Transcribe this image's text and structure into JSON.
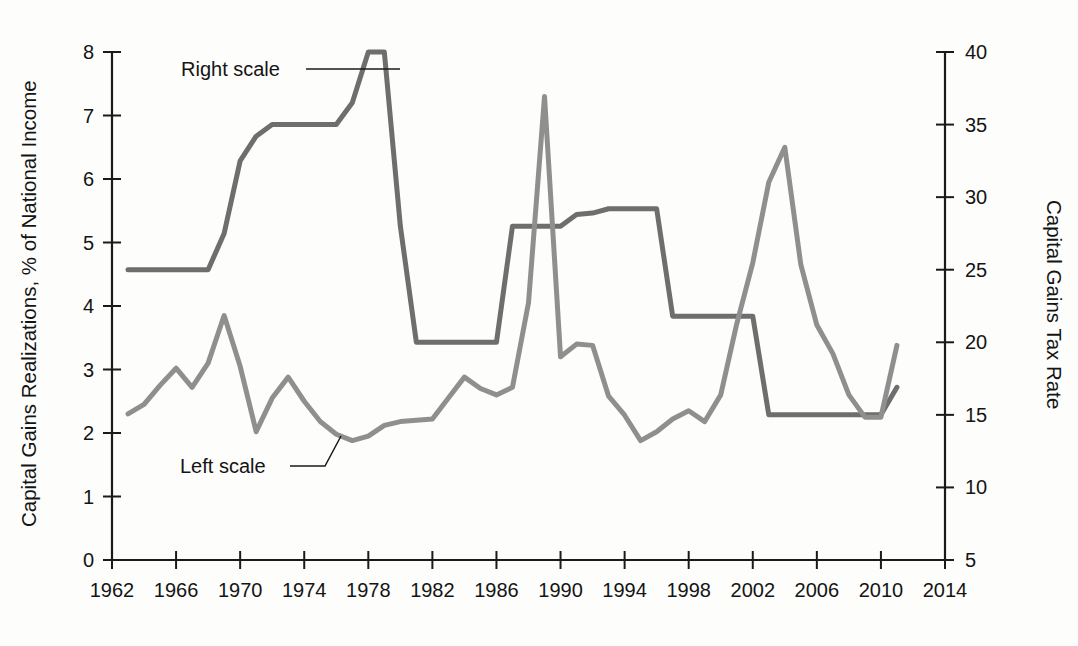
{
  "chart_data": {
    "type": "line",
    "title": "",
    "xlabel": "",
    "ylabel": "Capital Gains Realizations, % of National Income",
    "y2label": "Capital Gains Tax Rate",
    "xlim": [
      1962,
      2014
    ],
    "ylim": [
      0,
      8
    ],
    "y2lim": [
      5,
      40
    ],
    "grid": false,
    "legend": "inline-annotations",
    "x_ticks": [
      1962,
      1966,
      1970,
      1974,
      1978,
      1982,
      1986,
      1990,
      1994,
      1998,
      2002,
      2006,
      2010,
      2014
    ],
    "y_ticks": [
      0,
      1,
      2,
      3,
      4,
      5,
      6,
      7,
      8
    ],
    "y2_ticks": [
      5,
      10,
      15,
      20,
      25,
      30,
      35,
      40
    ],
    "annotations": [
      {
        "text": "Right scale",
        "points_to": "capital_gains_tax_rate"
      },
      {
        "text": "Left scale",
        "points_to": "capital_gains_realizations"
      }
    ],
    "series": [
      {
        "name": "Capital Gains Realizations, % of National Income",
        "axis": "left",
        "color": "#8f8f8f",
        "x": [
          1963,
          1964,
          1965,
          1966,
          1967,
          1968,
          1969,
          1970,
          1971,
          1972,
          1973,
          1974,
          1975,
          1976,
          1977,
          1978,
          1979,
          1980,
          1981,
          1982,
          1983,
          1984,
          1985,
          1986,
          1987,
          1988,
          1989,
          1990,
          1991,
          1992,
          1993,
          1994,
          1995,
          1996,
          1997,
          1998,
          1999,
          2000,
          2001,
          2002,
          2003,
          2004,
          2005,
          2006,
          2007,
          2008,
          2009,
          2010,
          2011
        ],
        "values": [
          2.3,
          2.45,
          2.75,
          3.02,
          2.72,
          3.1,
          3.85,
          3.05,
          2.02,
          2.55,
          2.88,
          2.5,
          2.18,
          1.98,
          1.88,
          1.95,
          2.12,
          2.18,
          2.2,
          2.22,
          2.55,
          2.88,
          2.7,
          2.6,
          2.72,
          4.05,
          7.3,
          3.2,
          3.4,
          3.38,
          2.58,
          2.28,
          1.88,
          2.02,
          2.22,
          2.35,
          2.18,
          2.6,
          3.72,
          4.68,
          5.95,
          6.5,
          4.65,
          3.7,
          3.25,
          2.6,
          2.25,
          2.25,
          3.38
        ],
        "linewidth": 5
      },
      {
        "name": "Capital Gains Tax Rate",
        "axis": "right",
        "color": "#6e6e6e",
        "x": [
          1963,
          1964,
          1965,
          1966,
          1967,
          1968,
          1969,
          1970,
          1971,
          1972,
          1973,
          1974,
          1975,
          1976,
          1977,
          1978,
          1979,
          1980,
          1981,
          1982,
          1983,
          1984,
          1985,
          1986,
          1987,
          1988,
          1989,
          1990,
          1991,
          1992,
          1993,
          1994,
          1995,
          1996,
          1997,
          1998,
          1999,
          2000,
          2001,
          2002,
          2003,
          2004,
          2005,
          2006,
          2007,
          2008,
          2009,
          2010,
          2011
        ],
        "values": [
          25.0,
          25.0,
          25.0,
          25.0,
          25.0,
          25.0,
          27.5,
          32.5,
          34.2,
          35.0,
          35.0,
          35.0,
          35.0,
          35.0,
          36.5,
          40.0,
          40.0,
          28.0,
          20.0,
          20.0,
          20.0,
          20.0,
          20.0,
          20.0,
          28.0,
          28.0,
          28.0,
          28.0,
          28.8,
          28.9,
          29.2,
          29.2,
          29.2,
          29.2,
          21.8,
          21.8,
          21.8,
          21.8,
          21.8,
          21.8,
          15.0,
          15.0,
          15.0,
          15.0,
          15.0,
          15.0,
          15.0,
          15.0,
          16.9
        ],
        "linewidth": 5
      }
    ]
  },
  "axes": {
    "left_title": "Capital Gains Realizations, % of National Income",
    "right_title": "Capital Gains Tax Rate",
    "left_ticks": [
      "8",
      "7",
      "6",
      "5",
      "4",
      "3",
      "2",
      "1",
      "0"
    ],
    "right_ticks": [
      "40",
      "35",
      "30",
      "25",
      "20",
      "15",
      "10",
      "5"
    ],
    "x_ticks": [
      "1962",
      "1966",
      "1970",
      "1974",
      "1978",
      "1982",
      "1986",
      "1990",
      "1994",
      "1998",
      "2002",
      "2006",
      "2010",
      "2014"
    ]
  },
  "annotations": {
    "right_scale_label": "Right scale",
    "left_scale_label": "Left scale"
  },
  "colors": {
    "background": "#fdfdfc",
    "axis": "#1a1a1a",
    "left_series": "#8f8f8f",
    "right_series": "#6e6e6e",
    "text": "#141414"
  }
}
